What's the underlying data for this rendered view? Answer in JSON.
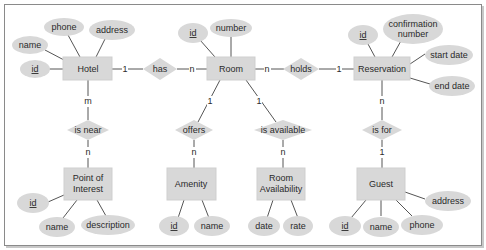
{
  "diagram": {
    "type": "entity-relationship",
    "colors": {
      "shape_fill": "#d8d8d8",
      "line": "#555555",
      "text": "#2a2a2a",
      "frame": "#8a8a8a"
    },
    "entities": [
      {
        "id": "hotel",
        "label": "Hotel",
        "attributes": [
          {
            "label": "id",
            "key": true
          },
          {
            "label": "name"
          },
          {
            "label": "phone"
          },
          {
            "label": "address"
          }
        ]
      },
      {
        "id": "room",
        "label": "Room",
        "attributes": [
          {
            "label": "id",
            "key": true
          },
          {
            "label": "number"
          }
        ]
      },
      {
        "id": "reservation",
        "label": "Reservation",
        "attributes": [
          {
            "label": "id",
            "key": true
          },
          {
            "label": "confirmation number"
          },
          {
            "label": "start date"
          },
          {
            "label": "end date"
          }
        ]
      },
      {
        "id": "poi",
        "label": "Point of Interest",
        "label_lines": [
          "Point of",
          "Interest"
        ],
        "attributes": [
          {
            "label": "id",
            "key": true
          },
          {
            "label": "name"
          },
          {
            "label": "description"
          }
        ]
      },
      {
        "id": "amenity",
        "label": "Amenity",
        "attributes": [
          {
            "label": "id",
            "key": true
          },
          {
            "label": "name"
          }
        ]
      },
      {
        "id": "room_availability",
        "label": "Room Availability",
        "label_lines": [
          "Room",
          "Availability"
        ],
        "attributes": [
          {
            "label": "date"
          },
          {
            "label": "rate"
          }
        ]
      },
      {
        "id": "guest",
        "label": "Guest",
        "attributes": [
          {
            "label": "id",
            "key": true
          },
          {
            "label": "name"
          },
          {
            "label": "phone"
          },
          {
            "label": "address"
          }
        ]
      }
    ],
    "relationships": [
      {
        "label": "has",
        "from": "hotel",
        "from_card": "1",
        "to": "room",
        "to_card": "n"
      },
      {
        "label": "holds",
        "from": "room",
        "from_card": "n",
        "to": "reservation",
        "to_card": "1"
      },
      {
        "label": "is near",
        "from": "hotel",
        "from_card": "m",
        "to": "poi",
        "to_card": "n"
      },
      {
        "label": "offers",
        "from": "room",
        "from_card": "1",
        "to": "amenity",
        "to_card": "n"
      },
      {
        "label": "is available",
        "from": "room",
        "from_card": "1",
        "to": "room_availability",
        "to_card": "n"
      },
      {
        "label": "is for",
        "from": "reservation",
        "from_card": "n",
        "to": "guest",
        "to_card": "1"
      }
    ]
  },
  "text": {
    "hotel": "Hotel",
    "hotel_id": "id",
    "hotel_name": "name",
    "hotel_phone": "phone",
    "hotel_address": "address",
    "room": "Room",
    "room_id": "id",
    "room_number": "number",
    "reservation": "Reservation",
    "res_id": "id",
    "res_conf_1": "confirmation",
    "res_conf_2": "number",
    "res_start": "start date",
    "res_end": "end date",
    "poi_1": "Point of",
    "poi_2": "Interest",
    "poi_id": "id",
    "poi_name": "name",
    "poi_desc": "description",
    "amenity": "Amenity",
    "amenity_id": "id",
    "amenity_name": "name",
    "ra_1": "Room",
    "ra_2": "Availability",
    "ra_date": "date",
    "ra_rate": "rate",
    "guest": "Guest",
    "guest_id": "id",
    "guest_name": "name",
    "guest_phone": "phone",
    "guest_address": "address",
    "rel_has": "has",
    "rel_holds": "holds",
    "rel_is_near": "is near",
    "rel_offers": "offers",
    "rel_is_available": "is available",
    "rel_is_for": "is for",
    "c_hotel_has": "1",
    "c_room_has": "n",
    "c_room_holds": "n",
    "c_res_holds": "1",
    "c_hotel_near": "m",
    "c_poi_near": "n",
    "c_room_offers": "1",
    "c_amen_offers": "n",
    "c_room_avail": "1",
    "c_ra_avail": "n",
    "c_res_for": "n",
    "c_guest_for": "1"
  }
}
